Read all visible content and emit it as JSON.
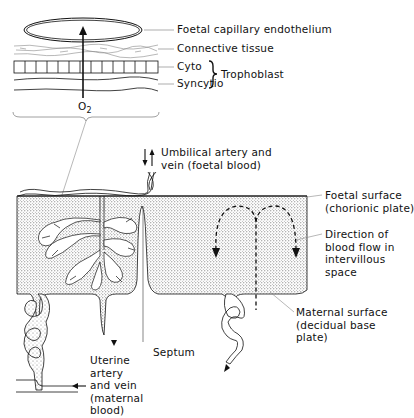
{
  "diagram": {
    "type": "anatomical-diagram",
    "inset": {
      "layers": [
        {
          "id": "endothelium",
          "label": "Foetal capillary endothelium"
        },
        {
          "id": "connective",
          "label": "Connective tissue"
        },
        {
          "id": "cyto",
          "label": "Cyto"
        },
        {
          "id": "syncytio",
          "label": "Syncytio"
        }
      ],
      "group_label": "Trophoblast",
      "gas_label": "O",
      "gas_subscript": "2"
    },
    "labels": {
      "umbilical": "Umbilical artery and\nvein (foetal blood)",
      "foetal_surface": "Foetal surface\n(chorionic plate)",
      "direction": "Direction of\nblood flow in\nintervillous\nspace",
      "maternal_surface": "Maternal surface\n(decidual base\nplate)",
      "septum": "Septum",
      "uterine": "Uterine\nartery\nand vein\n(maternal\nblood)"
    },
    "colors": {
      "ink": "#111111",
      "stipple": "#9a9a9a",
      "background": "#ffffff"
    }
  }
}
